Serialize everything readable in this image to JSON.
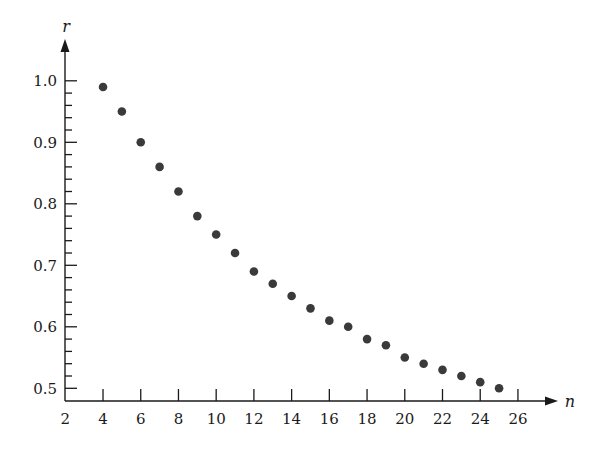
{
  "chart_data": {
    "type": "scatter",
    "title": "",
    "xlabel": "n",
    "ylabel": "r",
    "x": [
      4,
      5,
      6,
      7,
      8,
      9,
      10,
      11,
      12,
      13,
      14,
      15,
      16,
      17,
      18,
      19,
      20,
      21,
      22,
      23,
      24,
      25
    ],
    "series": [
      {
        "name": "r",
        "values": [
          0.99,
          0.95,
          0.9,
          0.86,
          0.82,
          0.78,
          0.75,
          0.72,
          0.69,
          0.67,
          0.65,
          0.63,
          0.61,
          0.6,
          0.58,
          0.57,
          0.55,
          0.54,
          0.53,
          0.52,
          0.51,
          0.5
        ]
      }
    ],
    "xlim": [
      2,
      27
    ],
    "ylim": [
      0.48,
      1.05
    ],
    "xticks": [
      2,
      4,
      6,
      8,
      10,
      12,
      14,
      16,
      18,
      20,
      22,
      24,
      26
    ],
    "xtick_labels": [
      "2",
      "4",
      "6",
      "8",
      "10",
      "12",
      "14",
      "16",
      "18",
      "20",
      "22",
      "24",
      "26"
    ],
    "yticks": [
      0.5,
      0.6,
      0.7,
      0.8,
      0.9,
      1.0
    ],
    "ytick_labels": [
      "0.5",
      "0.6",
      "0.7",
      "0.8",
      "0.9",
      "1.0"
    ],
    "y_minor_tick_step": 0.02,
    "grid": false,
    "legend": null,
    "colors": {
      "points": "#3a3a3a",
      "axes": "#1a1a1a",
      "background": "#ffffff"
    }
  }
}
